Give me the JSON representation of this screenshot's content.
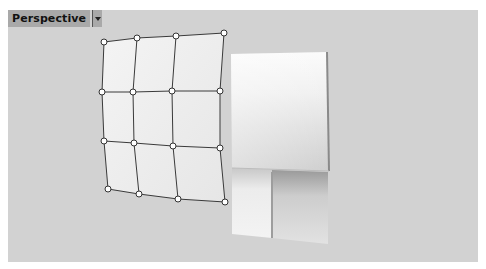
{
  "viewport": {
    "title": "Perspective",
    "dropdown_icon": "chevron-down-icon",
    "background_color": "#d2d2d2"
  },
  "scene": {
    "control_grid": {
      "rows": 4,
      "cols": 4,
      "points": [
        [
          [
            104,
            42
          ],
          [
            137,
            38
          ],
          [
            176,
            36
          ],
          [
            224,
            33
          ]
        ],
        [
          [
            102,
            92
          ],
          [
            133,
            92
          ],
          [
            172,
            91
          ],
          [
            220,
            91
          ]
        ],
        [
          [
            104,
            141
          ],
          [
            134,
            143
          ],
          [
            173,
            146
          ],
          [
            220,
            148
          ]
        ],
        [
          [
            108,
            189
          ],
          [
            139,
            194
          ],
          [
            178,
            199
          ],
          [
            225,
            202
          ]
        ]
      ]
    },
    "rendered_panel": {
      "top_left": [
        231,
        54
      ],
      "top_right": [
        327,
        52
      ],
      "bottom_right": [
        327,
        171
      ],
      "bottom_left": [
        232,
        168
      ]
    }
  }
}
